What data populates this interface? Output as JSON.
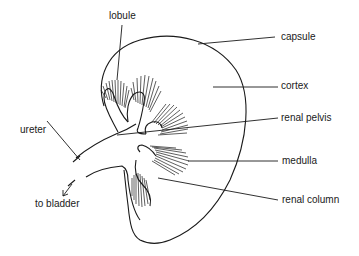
{
  "diagram": {
    "labels": {
      "lobule": "lobule",
      "capsule": "capsule",
      "cortex": "cortex",
      "renal_pelvis": "renal pelvis",
      "medulla": "medulla",
      "renal_column": "renal column",
      "ureter": "ureter",
      "to_bladder": "to bladder"
    },
    "colors": {
      "ink": "#1a1a1a",
      "background": "#ffffff"
    }
  }
}
